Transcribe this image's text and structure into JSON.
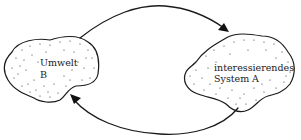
{
  "diagram": {
    "type": "system-environment-feedback",
    "nodes": [
      {
        "id": "B",
        "label_line1": "Umwelt",
        "label_line2": "B",
        "role": "environment",
        "position": "left"
      },
      {
        "id": "A",
        "label_line1": "interessierendes",
        "label_line2": "System",
        "label_tag": "A",
        "role": "system of interest",
        "position": "right"
      }
    ],
    "edges": [
      {
        "from": "B",
        "to": "A",
        "path": "upper arc"
      },
      {
        "from": "A",
        "to": "B",
        "path": "lower arc"
      }
    ],
    "colors": {
      "stroke": "#1a1a1a",
      "background": "#ffffff",
      "stipple": "#2a2a2a"
    }
  }
}
